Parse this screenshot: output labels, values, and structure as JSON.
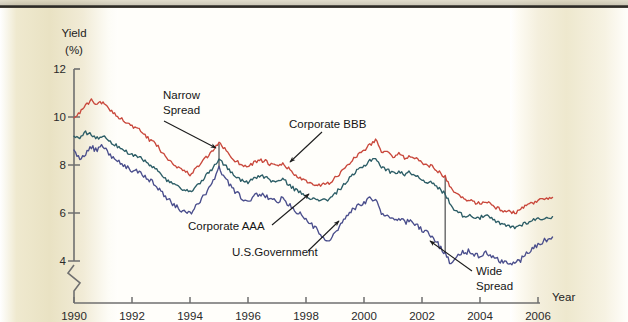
{
  "figure": {
    "background_color": "#fffefa",
    "page_gutter_color": "#e9e2c3",
    "top_rule_color": "#2b2924"
  },
  "axes": {
    "y_title_line1": "Yield",
    "y_title_line2": "(%)",
    "x_title": "Year",
    "y_ticks": [
      "12",
      "10",
      "8",
      "6",
      "4"
    ],
    "x_ticks": [
      "1990",
      "1992",
      "1994",
      "1996",
      "1998",
      "2000",
      "2002",
      "2004",
      "2006"
    ],
    "axis_break": "zigzag-below-4",
    "axis_color": "#6f6f6f"
  },
  "annotations": {
    "narrow_spread_line1": "Narrow",
    "narrow_spread_line2": "Spread",
    "corporate_bbb": "Corporate BBB",
    "corporate_aaa": "Corporate AAA",
    "us_government": "U.S.Government",
    "wide_spread_line1": "Wide",
    "wide_spread_line2": "Spread"
  },
  "chart_data": {
    "type": "line",
    "title": "",
    "xlabel": "Year",
    "ylabel": "Yield (%)",
    "xlim": [
      1990,
      2006.6
    ],
    "ylim": [
      3.0,
      12
    ],
    "y_axis_break_below": 4,
    "grid": false,
    "legend": "inline-annotations",
    "x_tick_values": [
      1990,
      1992,
      1994,
      1996,
      1998,
      2000,
      2002,
      2004,
      2006
    ],
    "y_tick_values": [
      4,
      6,
      8,
      10,
      12
    ],
    "series": [
      {
        "name": "Corporate BBB",
        "color": "#c9483c",
        "x": [
          1990.0,
          1990.2,
          1990.4,
          1990.6,
          1990.8,
          1991.0,
          1991.2,
          1991.4,
          1991.6,
          1991.8,
          1992.0,
          1992.2,
          1992.4,
          1992.6,
          1992.8,
          1993.0,
          1993.2,
          1993.4,
          1993.6,
          1993.8,
          1994.0,
          1994.2,
          1994.4,
          1994.6,
          1994.8,
          1995.0,
          1995.2,
          1995.4,
          1995.6,
          1995.8,
          1996.0,
          1996.2,
          1996.4,
          1996.6,
          1996.8,
          1997.0,
          1997.2,
          1997.4,
          1997.6,
          1997.8,
          1998.0,
          1998.2,
          1998.4,
          1998.6,
          1998.8,
          1999.0,
          1999.2,
          1999.4,
          1999.6,
          1999.8,
          2000.0,
          2000.2,
          2000.4,
          2000.6,
          2000.8,
          2001.0,
          2001.2,
          2001.4,
          2001.6,
          2001.8,
          2002.0,
          2002.2,
          2002.4,
          2002.6,
          2002.8,
          2003.0,
          2003.2,
          2003.4,
          2003.6,
          2003.8,
          2004.0,
          2004.2,
          2004.4,
          2004.6,
          2004.8,
          2005.0,
          2005.2,
          2005.4,
          2005.6,
          2005.8,
          2006.0,
          2006.3,
          2006.5
        ],
        "y": [
          10.0,
          10.2,
          10.45,
          10.7,
          10.55,
          10.6,
          10.35,
          10.15,
          9.95,
          9.8,
          9.6,
          9.5,
          9.3,
          9.05,
          8.9,
          8.6,
          8.3,
          8.1,
          7.9,
          7.75,
          7.6,
          7.85,
          8.1,
          8.35,
          8.6,
          8.9,
          8.7,
          8.35,
          8.15,
          8.0,
          7.95,
          8.1,
          8.2,
          8.15,
          8.0,
          7.95,
          8.05,
          7.85,
          7.6,
          7.45,
          7.3,
          7.2,
          7.1,
          7.25,
          7.2,
          7.45,
          7.7,
          7.95,
          8.2,
          8.45,
          8.6,
          8.85,
          9.05,
          8.6,
          8.5,
          8.35,
          8.45,
          8.3,
          8.4,
          8.25,
          8.1,
          8.0,
          7.9,
          7.7,
          7.5,
          7.0,
          6.8,
          6.6,
          6.55,
          6.45,
          6.4,
          6.5,
          6.35,
          6.2,
          6.1,
          6.05,
          6.0,
          6.15,
          6.3,
          6.4,
          6.5,
          6.6,
          6.65
        ]
      },
      {
        "name": "Corporate AAA",
        "color": "#2c5d66",
        "x": [
          1990.0,
          1990.2,
          1990.4,
          1990.6,
          1990.8,
          1991.0,
          1991.2,
          1991.4,
          1991.6,
          1991.8,
          1992.0,
          1992.2,
          1992.4,
          1992.6,
          1992.8,
          1993.0,
          1993.2,
          1993.4,
          1993.6,
          1993.8,
          1994.0,
          1994.2,
          1994.4,
          1994.6,
          1994.8,
          1995.0,
          1995.2,
          1995.4,
          1995.6,
          1995.8,
          1996.0,
          1996.2,
          1996.4,
          1996.6,
          1996.8,
          1997.0,
          1997.2,
          1997.4,
          1997.6,
          1997.8,
          1998.0,
          1998.2,
          1998.4,
          1998.6,
          1998.8,
          1999.0,
          1999.2,
          1999.4,
          1999.6,
          1999.8,
          2000.0,
          2000.2,
          2000.4,
          2000.6,
          2000.8,
          2001.0,
          2001.2,
          2001.4,
          2001.6,
          2001.8,
          2002.0,
          2002.2,
          2002.4,
          2002.6,
          2002.8,
          2003.0,
          2003.2,
          2003.4,
          2003.6,
          2003.8,
          2004.0,
          2004.2,
          2004.4,
          2004.6,
          2004.8,
          2005.0,
          2005.2,
          2005.4,
          2005.6,
          2005.8,
          2006.0,
          2006.3,
          2006.5
        ],
        "y": [
          9.2,
          9.15,
          9.35,
          9.3,
          9.1,
          9.2,
          9.05,
          8.85,
          8.7,
          8.55,
          8.4,
          8.35,
          8.2,
          8.0,
          7.85,
          7.6,
          7.35,
          7.2,
          7.05,
          6.95,
          6.85,
          7.1,
          7.35,
          7.6,
          7.9,
          8.25,
          8.0,
          7.7,
          7.5,
          7.35,
          7.3,
          7.45,
          7.55,
          7.5,
          7.35,
          7.3,
          7.4,
          7.2,
          7.0,
          6.85,
          6.75,
          6.6,
          6.5,
          6.6,
          6.55,
          6.8,
          7.05,
          7.3,
          7.55,
          7.8,
          7.95,
          8.2,
          8.3,
          7.9,
          7.8,
          7.65,
          7.75,
          7.6,
          7.7,
          7.55,
          7.4,
          7.3,
          7.2,
          7.0,
          6.8,
          6.3,
          6.1,
          5.9,
          5.9,
          5.85,
          5.8,
          5.9,
          5.75,
          5.6,
          5.5,
          5.45,
          5.4,
          5.5,
          5.6,
          5.7,
          5.75,
          5.8,
          5.85
        ]
      },
      {
        "name": "U.S.Government",
        "color": "#4a4e8c",
        "x": [
          1990.0,
          1990.2,
          1990.4,
          1990.6,
          1990.8,
          1991.0,
          1991.2,
          1991.4,
          1991.6,
          1991.8,
          1992.0,
          1992.2,
          1992.4,
          1992.6,
          1992.8,
          1993.0,
          1993.2,
          1993.4,
          1993.6,
          1993.8,
          1994.0,
          1994.2,
          1994.4,
          1994.6,
          1994.8,
          1995.0,
          1995.2,
          1995.4,
          1995.6,
          1995.8,
          1996.0,
          1996.2,
          1996.4,
          1996.6,
          1996.8,
          1997.0,
          1997.2,
          1997.4,
          1997.6,
          1997.8,
          1998.0,
          1998.2,
          1998.4,
          1998.6,
          1998.8,
          1999.0,
          1999.2,
          1999.4,
          1999.6,
          1999.8,
          2000.0,
          2000.2,
          2000.4,
          2000.6,
          2000.8,
          2001.0,
          2001.2,
          2001.4,
          2001.6,
          2001.8,
          2002.0,
          2002.2,
          2002.4,
          2002.6,
          2002.8,
          2003.0,
          2003.2,
          2003.4,
          2003.6,
          2003.8,
          2004.0,
          2004.2,
          2004.4,
          2004.6,
          2004.8,
          2005.0,
          2005.2,
          2005.4,
          2005.6,
          2005.8,
          2006.0,
          2006.3,
          2006.5
        ],
        "y": [
          8.6,
          8.3,
          8.5,
          8.75,
          8.6,
          8.8,
          8.5,
          8.25,
          8.05,
          7.9,
          7.8,
          7.7,
          7.55,
          7.35,
          7.2,
          6.9,
          6.6,
          6.4,
          6.2,
          6.05,
          5.95,
          6.3,
          6.6,
          6.95,
          7.35,
          7.85,
          7.5,
          7.1,
          6.85,
          6.6,
          6.5,
          6.7,
          6.8,
          6.7,
          6.55,
          6.5,
          6.6,
          6.35,
          6.1,
          5.95,
          5.75,
          5.5,
          5.3,
          4.9,
          4.8,
          5.15,
          5.5,
          5.85,
          6.1,
          6.3,
          6.4,
          6.6,
          6.55,
          6.0,
          5.9,
          5.7,
          5.8,
          5.6,
          5.7,
          5.5,
          5.3,
          5.2,
          5.0,
          4.6,
          4.3,
          3.9,
          4.2,
          4.35,
          4.4,
          4.3,
          4.2,
          4.35,
          4.2,
          4.05,
          3.95,
          3.9,
          3.85,
          4.05,
          4.3,
          4.5,
          4.7,
          4.9,
          5.0
        ]
      }
    ],
    "markers": [
      {
        "name": "narrow-spread-marker",
        "x": 1995.0,
        "y_top": 8.9,
        "y_bottom": 7.85,
        "label": "Narrow Spread"
      },
      {
        "name": "wide-spread-marker",
        "x": 2002.8,
        "y_top": 7.5,
        "y_bottom": 4.3,
        "label": "Wide Spread"
      }
    ]
  }
}
